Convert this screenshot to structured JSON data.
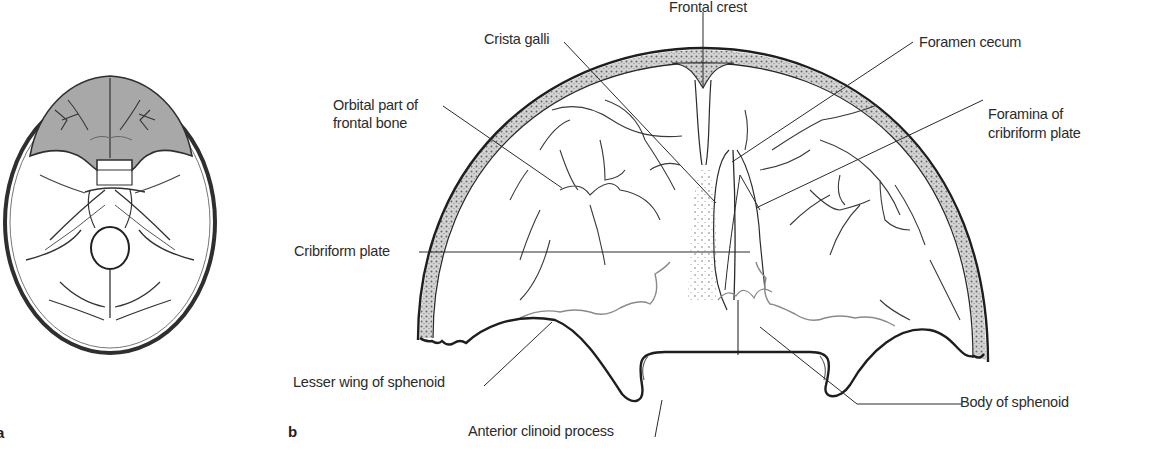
{
  "figure": {
    "panels": [
      {
        "id": "a",
        "label": "a",
        "description": "Interior of skull base (superior view) with anterior cranial fossa shaded"
      },
      {
        "id": "b",
        "label": "b",
        "description": "Enlarged anterior cranial fossa"
      }
    ],
    "shading_color": "#a9a9a9",
    "line_color": "#2a2a2a",
    "suture_color": "#8a8a8a",
    "labels": {
      "frontal_crest": "Frontal crest",
      "crista_galli": "Crista galli",
      "foramen_cecum": "Foramen cecum",
      "orbital_part": [
        "Orbital part of",
        "frontal bone"
      ],
      "foramina_cribriform": [
        "Foramina of",
        "cribriform plate"
      ],
      "cribriform_plate": "Cribriform plate",
      "lesser_wing": "Lesser wing of sphenoid",
      "body_sphenoid": "Body of sphenoid",
      "anterior_clinoid": "Anterior clinoid process"
    }
  }
}
